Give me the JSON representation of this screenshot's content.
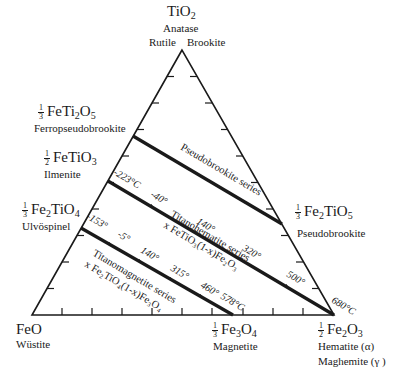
{
  "vertices": {
    "top": {
      "formula": "TiO2",
      "minerals": [
        "Anatase",
        "Rutile",
        "Brookite"
      ]
    },
    "bottom_left": {
      "formula": "FeO",
      "mineral": "Wüstite"
    },
    "bottom_right": {
      "formula_frac": "1/2",
      "formula": "Fe2O3",
      "minerals": [
        "Hematite (α)",
        "Maghemite (γ )"
      ]
    }
  },
  "edge_points": {
    "ferropseudobrookite": {
      "frac": "1/3",
      "formula": "FeTi2O5",
      "mineral": "Ferropseudobrookite"
    },
    "ilmenite": {
      "frac": "1/2",
      "formula": "FeTiO3",
      "mineral": "Ilmenite"
    },
    "ulvospinel": {
      "frac": "1/3",
      "formula": "Fe2TiO4",
      "mineral": "Ulvöspinel"
    },
    "pseudobrookite": {
      "frac": "1/3",
      "formula": "Fe2TiO5",
      "mineral": "Pseudobrookite"
    },
    "magnetite": {
      "frac": "1/3",
      "formula": "Fe3O4",
      "mineral": "Magnetite"
    }
  },
  "series": [
    {
      "name": "Pseudobrookite series",
      "formula": ""
    },
    {
      "name": "Titanohematite series",
      "formula": "x FeTiO3(1-x)Fe2O3",
      "temperatures": [
        "-223°C",
        "-40°",
        "140°",
        "320°",
        "500°",
        "680°C"
      ]
    },
    {
      "name": "Titanomagnetite series",
      "formula": "x Fe2TiO4(1-x)Fe3O4",
      "temperatures": [
        "-153°",
        "-5°",
        "140°",
        "315°",
        "460°",
        "578°C"
      ]
    }
  ],
  "labels": {
    "tio2": "TiO",
    "tio2_sub": "2",
    "anatase": "Anatase",
    "rutile": "Rutile",
    "brookite": "Brookite",
    "feo": "FeO",
    "wustite": "Wüstite",
    "fe2o3_frac_num": "1",
    "fe2o3_frac_den": "2",
    "hematite": "Hematite (α)",
    "maghemite": "Maghemite (γ )",
    "fetio5_frac_num": "1",
    "fetio5_frac_den": "3",
    "ferropseudobrookite": "Ferropseudobrookite",
    "ilmenite_frac_num": "1",
    "ilmenite_frac_den": "2",
    "ilmenite": "Ilmenite",
    "ulvo_frac_num": "1",
    "ulvo_frac_den": "3",
    "ulvospinel": "Ulvöspinel",
    "pb_frac_num": "1",
    "pb_frac_den": "3",
    "pseudobrookite": "Pseudobrookite",
    "mag_frac_num": "1",
    "mag_frac_den": "3",
    "magnetite": "Magnetite",
    "pseudobrookite_series": "Pseudobrookite series",
    "titanohematite_series": "Titanohematite series",
    "titanohematite_formula": "x FeTiO₃(1-x)Fe₂O₃",
    "titanomagnetite_series": "Titanomagnetite series",
    "titanomagnetite_formula": "x Fe₂TiO₄(1-x)Fe₃O₄",
    "th_t0": "-223°C",
    "th_t1": "-40°",
    "th_t2": "140°",
    "th_t3": "320°",
    "th_t4": "500°",
    "th_t5": "680°C",
    "tm_t0": "-153°",
    "tm_t1": "-5°",
    "tm_t2": "140°",
    "tm_t3": "315°",
    "tm_t4": "460°",
    "tm_t5": "578°C"
  },
  "colors": {
    "ink": "#1a1a1a",
    "background": "#ffffff"
  }
}
